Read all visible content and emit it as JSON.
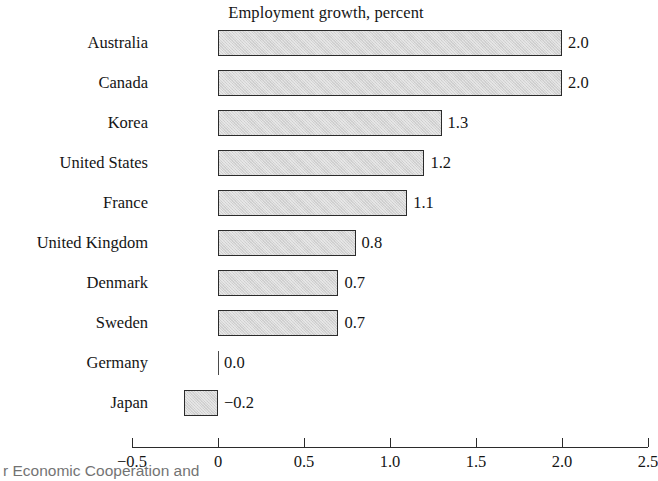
{
  "chart_data": {
    "type": "bar",
    "orientation": "horizontal",
    "title": "Employment growth, percent",
    "xlabel": "",
    "ylabel": "",
    "categories": [
      "Australia",
      "Canada",
      "Korea",
      "United States",
      "France",
      "United Kingdom",
      "Denmark",
      "Sweden",
      "Germany",
      "Japan"
    ],
    "values": [
      2.0,
      2.0,
      1.3,
      1.2,
      1.1,
      0.8,
      0.7,
      0.7,
      0.0,
      -0.2
    ],
    "value_labels": [
      "2.0",
      "2.0",
      "1.3",
      "1.2",
      "1.1",
      "0.8",
      "0.7",
      "0.7",
      "0.0",
      "−0.2"
    ],
    "xlim": [
      -0.5,
      2.5
    ],
    "xticks": [
      -0.5,
      0,
      0.5,
      1.0,
      1.5,
      2.0,
      2.5
    ],
    "xtick_labels": [
      "−0.5",
      "0",
      "0.5",
      "1.0",
      "1.5",
      "2.0",
      "2.5"
    ],
    "grid": false,
    "legend": "none",
    "bar_fill_color": "#d5d5d5",
    "bar_border_color": "#2b2b2b",
    "axis_color": "#2b2b2b",
    "background_color": "#ffffff"
  },
  "footnote": {
    "text": "r Economic Cooperation and"
  }
}
